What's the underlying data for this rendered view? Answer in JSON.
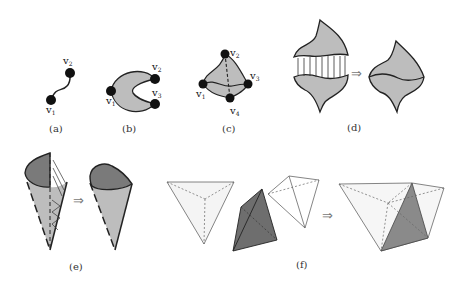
{
  "figure": {
    "panels": [
      {
        "id": "a",
        "caption": "(a)",
        "vertices": [
          "v1",
          "v2"
        ]
      },
      {
        "id": "b",
        "caption": "(b)",
        "vertices": [
          "v1",
          "v2",
          "v3"
        ]
      },
      {
        "id": "c",
        "caption": "(c)",
        "vertices": [
          "v1",
          "v2",
          "v3",
          "v4"
        ]
      },
      {
        "id": "d",
        "caption": "(d)"
      },
      {
        "id": "e",
        "caption": "(e)"
      },
      {
        "id": "f",
        "caption": "(f)"
      }
    ],
    "implies_symbol": "⇒",
    "vertex_letter": "v",
    "colors": {
      "fill_gray": "#bdbdbd",
      "fill_dark": "#7a7a7a",
      "stroke": "#222222",
      "tetra_light": "#f4f4f4",
      "tetra_dark": "#6e6e6e"
    }
  }
}
